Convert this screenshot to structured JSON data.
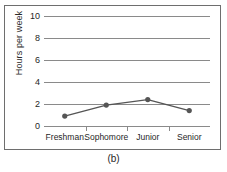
{
  "figure": {
    "caption": "(b)",
    "frame_color": "#6e6e6e",
    "background": "#ffffff"
  },
  "axes": {
    "y_title": "Hours per week",
    "y_ticks": [
      "0",
      "2",
      "4",
      "6",
      "8",
      "10"
    ],
    "x_ticks": [
      "Freshman",
      "Sophomore",
      "Junior",
      "Senior"
    ]
  },
  "chart_data": {
    "type": "line",
    "title": "",
    "xlabel": "",
    "ylabel": "Hours per week",
    "categories": [
      "Freshman",
      "Sophomore",
      "Junior",
      "Senior"
    ],
    "values": [
      0.9,
      1.9,
      2.4,
      1.4
    ],
    "ylim": [
      0,
      10
    ],
    "ytick_values": [
      0,
      2,
      4,
      6,
      8,
      10
    ],
    "grid": "horizontal",
    "legend": "none",
    "marker": "filled-circle",
    "line_color": "#555555",
    "marker_color": "#555555",
    "gridline_color": "#8a8a8a",
    "annotations": [
      "(b)"
    ]
  }
}
